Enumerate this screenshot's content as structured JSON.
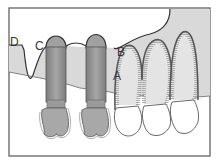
{
  "diagram": {
    "type": "dental-implant-cross-section",
    "labels": {
      "A": "A",
      "B": "B",
      "C": "C",
      "D": "D"
    },
    "colors": {
      "border": "#555555",
      "bone": "#d9d9d9",
      "gum_line": "#333333",
      "implant": "#9a9a9a",
      "implant_dark": "#7a7a7a",
      "crown": "#a8a8a8",
      "tooth": "#ffffff",
      "root_outline": "#555555"
    }
  }
}
